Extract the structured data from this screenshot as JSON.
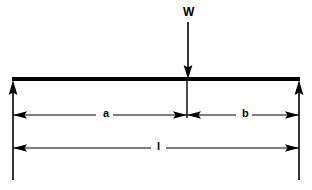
{
  "diagram": {
    "type": "free-body-diagram",
    "colors": {
      "line": "#000000",
      "background": "#ffffff"
    },
    "load": {
      "label": "W",
      "direction": "down",
      "x": 188,
      "label_x": 183,
      "label_y": 6,
      "arrow_top_y": 22,
      "arrow_tip_y": 78
    },
    "beam": {
      "x_start": 12,
      "x_end": 300,
      "y": 79,
      "thickness": 4
    },
    "reactions": [
      {
        "name": "left-reaction",
        "direction": "up",
        "x": 13,
        "arrow_tip_y": 80,
        "line_bottom_y": 180
      },
      {
        "name": "right-reaction",
        "direction": "up",
        "x": 299,
        "arrow_tip_y": 80,
        "line_bottom_y": 180
      }
    ],
    "witness_line": {
      "x": 187,
      "y_top": 79,
      "y_bottom": 118
    },
    "dimensions": [
      {
        "name": "dimension-a",
        "label": "a",
        "x_start": 13,
        "x_end": 187,
        "y": 115,
        "label_x": 104,
        "label_y": 109
      },
      {
        "name": "dimension-b",
        "label": "b",
        "x_start": 187,
        "x_end": 299,
        "y": 115,
        "label_x": 243,
        "label_y": 109
      },
      {
        "name": "dimension-l",
        "label": "l",
        "x_start": 13,
        "x_end": 299,
        "y": 148,
        "label_x": 157,
        "label_y": 142
      }
    ]
  }
}
